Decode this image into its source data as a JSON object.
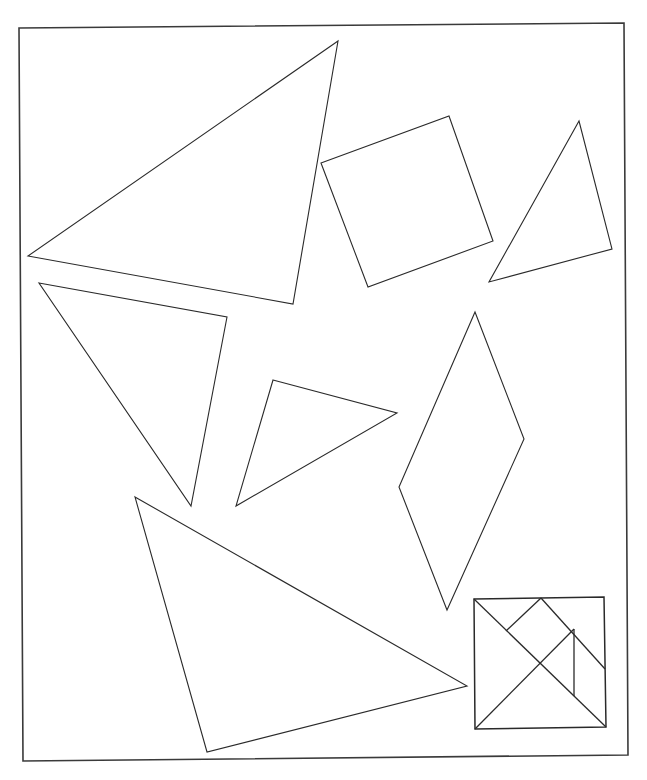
{
  "page": {
    "background": "#ffffff",
    "stroke_color": "#2a2a2a"
  },
  "frame": {
    "points": "19,28 624,23 628,755 23,761"
  },
  "pieces": [
    {
      "id": "large-triangle-top",
      "shape": "triangle",
      "points": "338,41 28,256 293,304"
    },
    {
      "id": "square",
      "shape": "square",
      "points": "321,163 449,116 493,241 368,287"
    },
    {
      "id": "small-triangle-right",
      "shape": "triangle",
      "points": "579,121 612,249 489,282"
    },
    {
      "id": "medium-triangle-left",
      "shape": "triangle",
      "points": "39,283 227,317 191,506"
    },
    {
      "id": "small-triangle-center",
      "shape": "triangle",
      "points": "273,380 397,413 236,506"
    },
    {
      "id": "parallelogram",
      "shape": "parallelogram",
      "points": "475,312 524,439 447,610 399,487"
    },
    {
      "id": "large-triangle-bottom",
      "shape": "triangle",
      "points": "135,497 467,686 207,752"
    }
  ],
  "solution_key": {
    "border": "474,599 604,597 606,727 475,729",
    "lines": [
      {
        "x1": 474,
        "y1": 599,
        "x2": 606,
        "y2": 727
      },
      {
        "x1": 475,
        "y1": 729,
        "x2": 574,
        "y2": 629
      },
      {
        "x1": 506,
        "y1": 631,
        "x2": 541,
        "y2": 598
      },
      {
        "x1": 541,
        "y1": 598,
        "x2": 605,
        "y2": 669
      },
      {
        "x1": 574,
        "y1": 629,
        "x2": 574,
        "y2": 696
      }
    ]
  }
}
